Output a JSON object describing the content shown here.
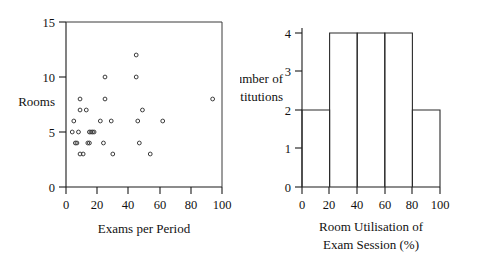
{
  "figure": {
    "background_color": "#ffffff",
    "ink_color": "#111111"
  },
  "chart_data": [
    {
      "type": "scatter",
      "title": "",
      "xlabel": "Exams per Period",
      "ylabel": "Rooms",
      "xlim": [
        0,
        100
      ],
      "ylim": [
        0,
        15
      ],
      "xticks": [
        0,
        20,
        40,
        60,
        80,
        100
      ],
      "xtick_labels": [
        "0",
        "20",
        "40",
        "60",
        "80",
        "100"
      ],
      "yticks": [
        0,
        5,
        10,
        15
      ],
      "ytick_labels": [
        "0",
        "5",
        "10",
        "15"
      ],
      "grid": false,
      "legend": null,
      "marker": "open-circle",
      "points": [
        [
          45,
          12
        ],
        [
          25,
          10
        ],
        [
          45,
          10
        ],
        [
          9,
          8
        ],
        [
          25,
          8
        ],
        [
          94,
          8
        ],
        [
          9,
          7
        ],
        [
          13,
          7
        ],
        [
          49,
          7
        ],
        [
          5,
          6
        ],
        [
          22,
          6
        ],
        [
          29,
          6
        ],
        [
          46,
          6
        ],
        [
          62,
          6
        ],
        [
          4,
          5
        ],
        [
          8,
          5
        ],
        [
          15,
          5
        ],
        [
          16,
          5
        ],
        [
          17,
          5
        ],
        [
          18,
          5
        ],
        [
          6,
          4
        ],
        [
          7,
          4
        ],
        [
          14,
          4
        ],
        [
          15,
          4
        ],
        [
          24,
          4
        ],
        [
          47,
          4
        ],
        [
          9,
          3
        ],
        [
          11,
          3
        ],
        [
          30,
          3
        ],
        [
          54,
          3
        ]
      ]
    },
    {
      "type": "bar",
      "title": "",
      "xlabel_line1": "Room Utilisation of",
      "xlabel_line2": "Exam Session (%)",
      "ylabel_line1": "Number of",
      "ylabel_line2": "Institutions",
      "xlim": [
        0,
        100
      ],
      "ylim": [
        0,
        4
      ],
      "xticks": [
        0,
        20,
        40,
        60,
        80,
        100
      ],
      "xtick_labels": [
        "0",
        "20",
        "40",
        "60",
        "80",
        "100"
      ],
      "yticks": [
        0,
        1,
        2,
        3,
        4
      ],
      "ytick_labels": [
        "0",
        "1",
        "2",
        "3",
        "4"
      ],
      "grid": false,
      "legend": null,
      "bin_edges": [
        0,
        20,
        40,
        60,
        80,
        100
      ],
      "bin_ranges": [
        "0-20",
        "20-40",
        "40-60",
        "60-80",
        "80-100"
      ],
      "values": [
        2,
        4,
        4,
        4,
        2
      ]
    }
  ]
}
